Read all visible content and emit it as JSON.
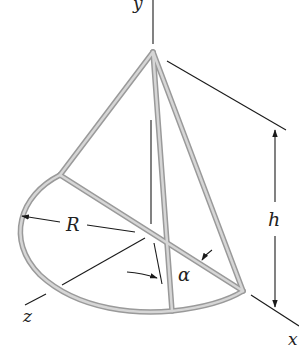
{
  "figure": {
    "labels": {
      "y_axis": "y",
      "x_axis": "x",
      "z_axis": "z",
      "height": "h",
      "radius": "R",
      "angle": "α"
    },
    "colors": {
      "rod_outline": "#9a9a9a",
      "rod_fill": "#d6d6d6",
      "lines": "#1a1a1a",
      "background": "#ffffff"
    }
  }
}
